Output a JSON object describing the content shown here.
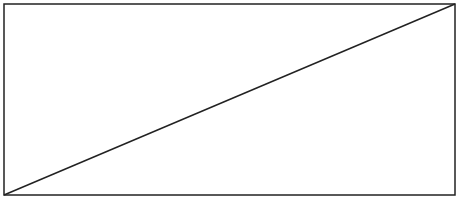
{
  "diagram": {
    "shapes": [
      {
        "type": "rectangle",
        "x": 4,
        "y": 4,
        "width": 451,
        "height": 191,
        "stroke": "#222222",
        "fill": "#ffffff"
      },
      {
        "type": "line",
        "x1": 4,
        "y1": 195,
        "x2": 455,
        "y2": 4,
        "stroke": "#222222"
      }
    ]
  }
}
